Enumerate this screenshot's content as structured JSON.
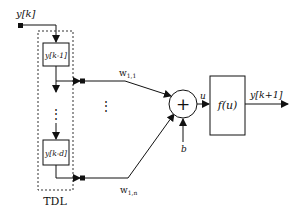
{
  "diagram": {
    "input_label": "y[k]",
    "tdl": {
      "label": "TDL",
      "delay_first": "y[k-1]",
      "delay_last": "y[k-d]",
      "ellipsis": "⋮"
    },
    "weights": {
      "first": "w",
      "first_sub": "1,1",
      "last": "w",
      "last_sub": "1,n",
      "ellipsis": "⋮"
    },
    "summer": {
      "symbol": "+"
    },
    "bias_label": "b",
    "sum_output_label": "u",
    "activation": {
      "label": "f(u)"
    },
    "output_label": "y[k+1]"
  }
}
